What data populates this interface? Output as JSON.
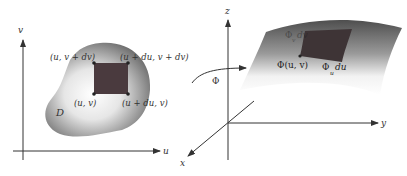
{
  "left_panel": {
    "axis_v_label": "v",
    "axis_u_label": "u",
    "region_label": "D",
    "corner_labels": {
      "top_left": "(u, v + dv)",
      "top_right": "(u + du, v + dv)",
      "bottom_left": "(u, v)",
      "bottom_right": "(u + du, v)"
    }
  },
  "map_label": "Φ",
  "right_panel": {
    "axis_z_label": "z",
    "axis_y_label": "y",
    "axis_x_label": "x",
    "point_label": "Φ(u, v)",
    "phi_u_label": "Φ",
    "phi_u_sub": "u",
    "phi_u_suffix": "du",
    "phi_v_label": "Φ",
    "phi_v_sub": "v",
    "phi_v_suffix": "dv"
  },
  "colors": {
    "patch": "#4a3a3e",
    "surface_dark": "#5a5a5a",
    "axis": "#333333"
  }
}
